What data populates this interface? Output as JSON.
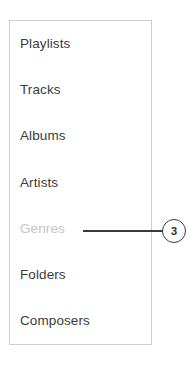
{
  "panel": {
    "name": "library-navigation-menu",
    "border_color": "#cfcfcf",
    "background_color": "#ffffff",
    "items": [
      {
        "label": "Playlists",
        "state": "normal"
      },
      {
        "label": "Tracks",
        "state": "normal"
      },
      {
        "label": "Albums",
        "state": "normal"
      },
      {
        "label": "Artists",
        "state": "normal"
      },
      {
        "label": "Genres",
        "state": "dimmed"
      },
      {
        "label": "Folders",
        "state": "normal"
      },
      {
        "label": "Composers",
        "state": "normal"
      }
    ],
    "text_color": "#3b3b3b",
    "dimmed_text_color": "#c6c6c6"
  },
  "callout": {
    "number": "3",
    "target_item_label": "Genres",
    "line_color": "#3a3a3a",
    "badge_border_color": "#3a3a3a",
    "badge_text_color": "#2d2d2d"
  }
}
